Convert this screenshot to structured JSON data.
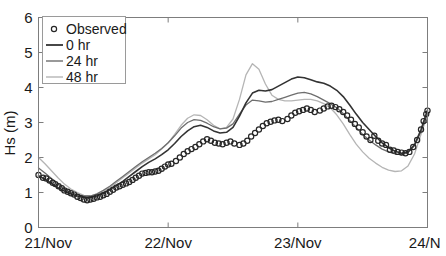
{
  "chart_data": {
    "type": "line",
    "title": "",
    "xlabel": "",
    "ylabel": "Hs (m)",
    "ylim": [
      0,
      6
    ],
    "yticks": [
      0,
      1,
      2,
      3,
      4,
      5,
      6
    ],
    "ytick_labels": [
      "0",
      "1",
      "2",
      "3",
      "4",
      "5",
      "6"
    ],
    "xlim": [
      0,
      3
    ],
    "xticks": [
      0,
      1,
      2,
      3
    ],
    "xtick_labels": [
      "21/Nov",
      "22/Nov",
      "23/Nov",
      "24/N"
    ],
    "grid": false,
    "legend_position": "upper-left",
    "legend": [
      {
        "label": "Observed",
        "marker": "open-circle",
        "color": "#262626"
      },
      {
        "label": "0 hr",
        "marker": "line",
        "color": "#333333"
      },
      {
        "label": "24 hr",
        "marker": "line",
        "color": "#6e6e6e"
      },
      {
        "label": "48 hr",
        "marker": "line",
        "color": "#b5b5b5"
      }
    ],
    "series": [
      {
        "name": "Observed",
        "style": "open-circle",
        "color": "#262626",
        "x": [
          0.0,
          0.031,
          0.062,
          0.093,
          0.124,
          0.155,
          0.186,
          0.217,
          0.248,
          0.279,
          0.31,
          0.341,
          0.372,
          0.403,
          0.434,
          0.465,
          0.496,
          0.527,
          0.558,
          0.589,
          0.62,
          0.651,
          0.682,
          0.713,
          0.744,
          0.775,
          0.806,
          0.837,
          0.868,
          0.899,
          0.93,
          0.961,
          0.992,
          1.023,
          1.054,
          1.085,
          1.116,
          1.147,
          1.178,
          1.209,
          1.24,
          1.271,
          1.302,
          1.333,
          1.364,
          1.395,
          1.426,
          1.457,
          1.488,
          1.519,
          1.55,
          1.581,
          1.612,
          1.643,
          1.674,
          1.705,
          1.736,
          1.767,
          1.798,
          1.829,
          1.86,
          1.891,
          1.922,
          1.953,
          1.984,
          2.015,
          2.046,
          2.077,
          2.108,
          2.139,
          2.17,
          2.201,
          2.232,
          2.263,
          2.294,
          2.325,
          2.356,
          2.387,
          2.418,
          2.449,
          2.48,
          2.511,
          2.542,
          2.573,
          2.604,
          2.635,
          2.666,
          2.697,
          2.728,
          2.759,
          2.79,
          2.821,
          2.852,
          2.883,
          2.914,
          2.945,
          2.976,
          3.0
        ],
        "y": [
          1.5,
          1.46,
          1.38,
          1.33,
          1.28,
          1.22,
          1.16,
          1.08,
          1.02,
          0.98,
          0.94,
          0.9,
          0.86,
          0.83,
          0.8,
          0.78,
          0.8,
          0.82,
          0.86,
          0.88,
          0.9,
          0.94,
          0.98,
          1.02,
          1.08,
          1.14,
          1.18,
          1.22,
          1.26,
          1.3,
          1.34,
          1.38,
          1.44,
          1.5,
          1.54,
          1.56,
          1.58,
          1.58,
          1.6,
          1.62,
          1.66,
          1.7,
          1.74,
          1.78,
          1.8,
          1.82,
          1.9,
          1.98,
          2.06,
          2.14,
          2.2,
          2.26,
          2.32,
          2.38,
          2.44,
          2.5,
          2.54,
          2.5,
          2.44,
          2.42,
          2.4,
          2.38,
          2.42,
          2.46,
          2.4,
          2.36,
          2.44,
          2.54,
          2.66,
          2.76,
          2.86,
          3.0,
          3.14,
          3.22,
          3.18,
          3.26,
          3.4,
          3.5,
          3.42,
          3.28,
          3.34,
          3.4,
          3.46,
          3.44,
          3.4,
          3.34,
          3.24,
          3.12,
          3.0,
          2.9,
          2.74,
          2.56,
          2.42,
          2.3,
          2.38,
          2.64,
          2.96,
          3.3
        ],
        "marker_points": [
          [
            0.0,
            1.5
          ],
          [
            0.035,
            1.42
          ],
          [
            0.06,
            1.4
          ],
          [
            0.085,
            1.34
          ],
          [
            0.11,
            1.28
          ],
          [
            0.13,
            1.24
          ],
          [
            0.155,
            1.18
          ],
          [
            0.18,
            1.12
          ],
          [
            0.2,
            1.06
          ],
          [
            0.225,
            1.02
          ],
          [
            0.25,
            0.98
          ],
          [
            0.275,
            0.94
          ],
          [
            0.3,
            0.88
          ],
          [
            0.325,
            0.84
          ],
          [
            0.35,
            0.8
          ],
          [
            0.375,
            0.78
          ],
          [
            0.4,
            0.8
          ],
          [
            0.425,
            0.82
          ],
          [
            0.45,
            0.86
          ],
          [
            0.475,
            0.88
          ],
          [
            0.5,
            0.92
          ],
          [
            0.525,
            0.96
          ],
          [
            0.55,
            1.02
          ],
          [
            0.575,
            1.08
          ],
          [
            0.6,
            1.14
          ],
          [
            0.625,
            1.18
          ],
          [
            0.65,
            1.22
          ],
          [
            0.675,
            1.26
          ],
          [
            0.7,
            1.3
          ],
          [
            0.725,
            1.36
          ],
          [
            0.75,
            1.42
          ],
          [
            0.775,
            1.48
          ],
          [
            0.8,
            1.54
          ],
          [
            0.825,
            1.56
          ],
          [
            0.85,
            1.58
          ],
          [
            0.875,
            1.58
          ],
          [
            0.9,
            1.6
          ],
          [
            0.925,
            1.62
          ],
          [
            0.95,
            1.68
          ],
          [
            0.975,
            1.74
          ],
          [
            1.0,
            1.8
          ],
          [
            1.025,
            1.82
          ],
          [
            1.06,
            1.9
          ],
          [
            1.09,
            2.0
          ],
          [
            1.12,
            2.1
          ],
          [
            1.15,
            2.18
          ],
          [
            1.18,
            2.24
          ],
          [
            1.21,
            2.3
          ],
          [
            1.24,
            2.38
          ],
          [
            1.27,
            2.46
          ],
          [
            1.3,
            2.52
          ],
          [
            1.33,
            2.48
          ],
          [
            1.36,
            2.42
          ],
          [
            1.39,
            2.4
          ],
          [
            1.42,
            2.38
          ],
          [
            1.45,
            2.42
          ],
          [
            1.48,
            2.46
          ],
          [
            1.51,
            2.4
          ],
          [
            1.55,
            2.36
          ],
          [
            1.58,
            2.4
          ],
          [
            1.61,
            2.48
          ],
          [
            1.64,
            2.6
          ],
          [
            1.67,
            2.7
          ],
          [
            1.7,
            2.8
          ],
          [
            1.73,
            2.9
          ],
          [
            1.76,
            2.98
          ],
          [
            1.79,
            3.02
          ],
          [
            1.82,
            3.06
          ],
          [
            1.85,
            3.08
          ],
          [
            1.88,
            3.04
          ],
          [
            1.92,
            3.1
          ],
          [
            1.95,
            3.2
          ],
          [
            1.98,
            3.28
          ],
          [
            2.01,
            3.32
          ],
          [
            2.04,
            3.36
          ],
          [
            2.07,
            3.4
          ],
          [
            2.1,
            3.36
          ],
          [
            2.13,
            3.3
          ],
          [
            2.17,
            3.34
          ],
          [
            2.2,
            3.4
          ],
          [
            2.23,
            3.46
          ],
          [
            2.26,
            3.48
          ],
          [
            2.29,
            3.44
          ],
          [
            2.32,
            3.38
          ],
          [
            2.35,
            3.3
          ],
          [
            2.38,
            3.2
          ],
          [
            2.41,
            3.08
          ],
          [
            2.44,
            2.96
          ],
          [
            2.47,
            2.86
          ],
          [
            2.5,
            2.72
          ],
          [
            2.53,
            2.6
          ],
          [
            2.56,
            2.5
          ],
          [
            2.59,
            2.62
          ],
          [
            2.62,
            2.48
          ],
          [
            2.65,
            2.4
          ],
          [
            2.68,
            2.36
          ],
          [
            2.71,
            2.22
          ],
          [
            2.74,
            2.2
          ],
          [
            2.77,
            2.16
          ],
          [
            2.8,
            2.14
          ],
          [
            2.83,
            2.12
          ],
          [
            2.86,
            2.16
          ],
          [
            2.89,
            2.3
          ],
          [
            2.92,
            2.5
          ],
          [
            2.95,
            2.8
          ],
          [
            2.97,
            3.04
          ],
          [
            2.99,
            3.24
          ],
          [
            3.0,
            3.34
          ]
        ]
      },
      {
        "name": "0 hr",
        "style": "solid",
        "color": "#333333",
        "width": 1.6,
        "x": [
          0.0,
          0.05,
          0.1,
          0.15,
          0.2,
          0.25,
          0.3,
          0.35,
          0.4,
          0.45,
          0.5,
          0.55,
          0.6,
          0.65,
          0.7,
          0.75,
          0.8,
          0.85,
          0.9,
          0.95,
          1.0,
          1.05,
          1.1,
          1.15,
          1.2,
          1.25,
          1.3,
          1.35,
          1.4,
          1.45,
          1.5,
          1.55,
          1.6,
          1.65,
          1.7,
          1.75,
          1.8,
          1.85,
          1.9,
          1.95,
          2.0,
          2.05,
          2.1,
          2.15,
          2.2,
          2.25,
          2.3,
          2.35,
          2.4,
          2.45,
          2.5,
          2.55,
          2.6,
          2.65,
          2.7,
          2.75,
          2.8,
          2.85,
          2.9,
          2.95,
          3.0
        ],
        "y": [
          1.48,
          1.38,
          1.26,
          1.14,
          1.04,
          0.96,
          0.9,
          0.86,
          0.86,
          0.9,
          0.98,
          1.08,
          1.2,
          1.32,
          1.46,
          1.6,
          1.74,
          1.86,
          1.96,
          2.08,
          2.22,
          2.4,
          2.6,
          2.76,
          2.88,
          2.92,
          2.86,
          2.76,
          2.7,
          2.72,
          2.86,
          3.18,
          3.56,
          3.84,
          3.92,
          3.9,
          3.94,
          4.04,
          4.14,
          4.24,
          4.3,
          4.28,
          4.22,
          4.16,
          4.12,
          4.04,
          3.92,
          3.74,
          3.5,
          3.24,
          3.0,
          2.8,
          2.6,
          2.42,
          2.28,
          2.18,
          2.12,
          2.16,
          2.36,
          2.8,
          3.36
        ]
      },
      {
        "name": "24 hr",
        "style": "solid",
        "color": "#6e6e6e",
        "width": 1.3,
        "x": [
          0.0,
          0.05,
          0.1,
          0.15,
          0.2,
          0.25,
          0.3,
          0.35,
          0.4,
          0.45,
          0.5,
          0.55,
          0.6,
          0.65,
          0.7,
          0.75,
          0.8,
          0.85,
          0.9,
          0.95,
          1.0,
          1.05,
          1.1,
          1.15,
          1.2,
          1.25,
          1.3,
          1.35,
          1.4,
          1.45,
          1.5,
          1.55,
          1.6,
          1.65,
          1.7,
          1.75,
          1.8,
          1.85,
          1.9,
          1.95,
          2.0,
          2.05,
          2.1,
          2.15,
          2.2,
          2.25,
          2.3,
          2.35,
          2.4,
          2.45,
          2.5,
          2.55,
          2.6,
          2.65,
          2.7,
          2.75,
          2.8,
          2.85,
          2.9,
          2.95,
          3.0
        ],
        "y": [
          1.7,
          1.56,
          1.4,
          1.24,
          1.1,
          1.0,
          0.94,
          0.9,
          0.9,
          0.96,
          1.06,
          1.18,
          1.32,
          1.46,
          1.6,
          1.74,
          1.88,
          2.0,
          2.12,
          2.26,
          2.42,
          2.62,
          2.84,
          3.0,
          3.08,
          3.06,
          2.98,
          2.88,
          2.82,
          2.84,
          2.96,
          3.24,
          3.5,
          3.64,
          3.62,
          3.58,
          3.6,
          3.66,
          3.72,
          3.78,
          3.84,
          3.86,
          3.82,
          3.74,
          3.64,
          3.54,
          3.42,
          3.26,
          3.06,
          2.86,
          2.66,
          2.5,
          2.36,
          2.24,
          2.16,
          2.1,
          2.08,
          2.14,
          2.34,
          2.74,
          3.26
        ]
      },
      {
        "name": "48 hr",
        "style": "solid",
        "color": "#b5b5b5",
        "width": 1.3,
        "x": [
          0.0,
          0.05,
          0.1,
          0.15,
          0.2,
          0.25,
          0.3,
          0.35,
          0.4,
          0.45,
          0.5,
          0.55,
          0.6,
          0.65,
          0.7,
          0.75,
          0.8,
          0.85,
          0.9,
          0.95,
          1.0,
          1.05,
          1.1,
          1.15,
          1.2,
          1.25,
          1.3,
          1.35,
          1.4,
          1.45,
          1.5,
          1.55,
          1.6,
          1.65,
          1.7,
          1.75,
          1.8,
          1.85,
          1.9,
          1.95,
          2.0,
          2.05,
          2.1,
          2.15,
          2.2,
          2.25,
          2.3,
          2.35,
          2.4,
          2.45,
          2.5,
          2.55,
          2.6,
          2.65,
          2.7,
          2.75,
          2.8,
          2.85,
          2.9,
          2.95,
          3.0
        ],
        "y": [
          2.0,
          1.82,
          1.62,
          1.42,
          1.24,
          1.1,
          1.0,
          0.92,
          0.9,
          0.94,
          1.02,
          1.14,
          1.28,
          1.42,
          1.56,
          1.7,
          1.84,
          1.96,
          2.08,
          2.24,
          2.42,
          2.66,
          2.92,
          3.12,
          3.22,
          3.2,
          3.08,
          2.92,
          2.82,
          2.86,
          3.1,
          3.66,
          4.36,
          4.68,
          4.52,
          4.1,
          3.78,
          3.66,
          3.62,
          3.62,
          3.64,
          3.66,
          3.66,
          3.62,
          3.54,
          3.42,
          3.22,
          2.96,
          2.66,
          2.38,
          2.16,
          1.98,
          1.84,
          1.72,
          1.64,
          1.6,
          1.62,
          1.76,
          2.1,
          2.66,
          3.22
        ]
      }
    ]
  },
  "axes": {
    "y_title": "Hs (m)"
  }
}
